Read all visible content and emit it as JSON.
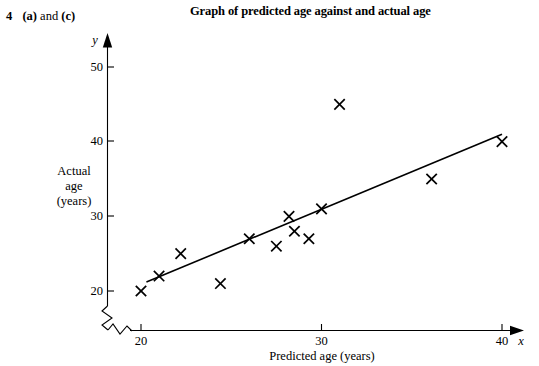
{
  "question": {
    "number": "4",
    "parts": "(a) and (c)",
    "part_a": "(a)",
    "conjunction": "and",
    "part_c": "(c)"
  },
  "chart_title": "Graph of predicted age against and actual age",
  "chart_data": {
    "type": "scatter",
    "title": "Graph of predicted age against and actual age",
    "xlabel": "Predicted age (years)",
    "ylabel": "Actual age (years)",
    "y_axis_label_lines": [
      "Actual",
      "age",
      "(years)"
    ],
    "x_axis_variable": "x",
    "y_axis_variable": "y",
    "xlim": [
      18.5,
      41
    ],
    "ylim": [
      18.5,
      52
    ],
    "xticks": [
      20,
      30,
      40
    ],
    "yticks": [
      20,
      30,
      40,
      50
    ],
    "xtick_labels": [
      "20",
      "30",
      "40"
    ],
    "ytick_labels": [
      "20",
      "30",
      "40",
      "50"
    ],
    "grid": false,
    "legend": "none",
    "axis_break_x": true,
    "axis_break_y": true,
    "marker": "x-cross",
    "marker_color": "#000000",
    "points": [
      {
        "x": 20.0,
        "y": 20.0
      },
      {
        "x": 21.0,
        "y": 22.0
      },
      {
        "x": 22.2,
        "y": 25.0
      },
      {
        "x": 24.4,
        "y": 21.0
      },
      {
        "x": 26.0,
        "y": 27.0
      },
      {
        "x": 27.5,
        "y": 26.0
      },
      {
        "x": 28.2,
        "y": 30.0
      },
      {
        "x": 28.5,
        "y": 28.0
      },
      {
        "x": 29.3,
        "y": 27.0
      },
      {
        "x": 30.0,
        "y": 31.0
      },
      {
        "x": 31.0,
        "y": 45.0
      },
      {
        "x": 36.1,
        "y": 35.0
      },
      {
        "x": 40.0,
        "y": 40.0
      }
    ],
    "trend_line": {
      "label": "line of best fit",
      "x1": 20.3,
      "y1": 21.2,
      "x2": 40.0,
      "y2": 41.0,
      "color": "#000000"
    }
  }
}
